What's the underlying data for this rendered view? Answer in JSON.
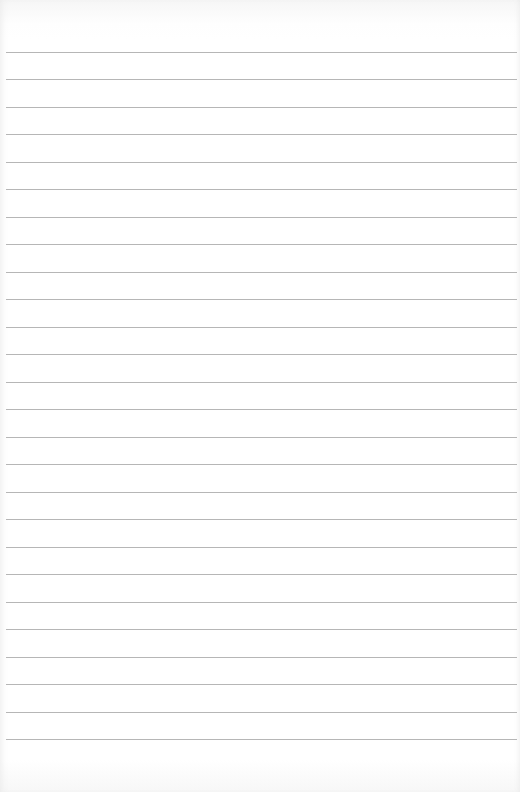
{
  "paper": {
    "type": "ruled-notebook-page",
    "line_color": "#a9a9a9",
    "background_color": "#ffffff",
    "first_line_y": 52,
    "line_spacing": 27.48,
    "line_count": 26
  }
}
